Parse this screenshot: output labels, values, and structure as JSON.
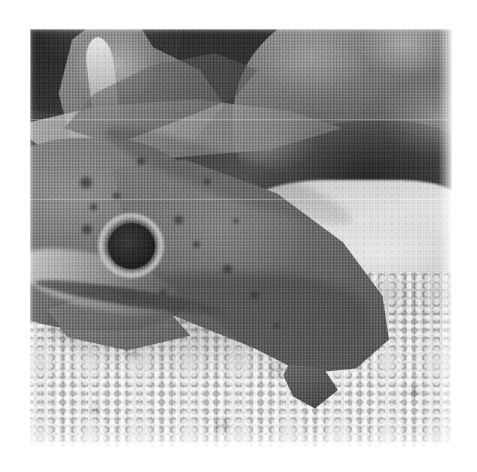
{
  "page": {
    "background_color": "#ffffff",
    "width": 477,
    "height": 472,
    "content_type": "scanned-halftone-photograph",
    "color_mode": "grayscale"
  },
  "figure": {
    "name": "underwater-photograph",
    "caption": "",
    "alt_text": "Black and white halftone photograph of a spotted catshark resting on a gravel seabed in front of rocks",
    "frame": {
      "left": 30,
      "top": 29,
      "width": 422,
      "height": 419
    },
    "tone": {
      "darkest": "#1a1a1a",
      "shadow": "#3a3a3a",
      "midtone": "#7b7b7b",
      "highlight": "#d8d8d8",
      "lightest": "#ececec"
    }
  },
  "scene": {
    "subject": "catshark",
    "habitat": "aquarium gravel bed with rocks",
    "regions": [
      {
        "id": "rock-top-left",
        "label": "dark rock, upper left corner"
      },
      {
        "id": "pale-rock-slab",
        "label": "pale angular rock slab, upper left"
      },
      {
        "id": "coral-prong",
        "label": "bright vertical prong, top left"
      },
      {
        "id": "boulder-upper-right",
        "label": "rough textured boulder, upper right"
      },
      {
        "id": "gravel-band",
        "label": "bright gravel band, mid right"
      },
      {
        "id": "gravel-bed",
        "label": "foreground gravel and sand bed"
      }
    ]
  },
  "fish": {
    "label": "catshark",
    "parts": [
      {
        "id": "head",
        "label": "head and snout"
      },
      {
        "id": "eye",
        "label": "eye"
      },
      {
        "id": "trunk",
        "label": "body flank"
      },
      {
        "id": "pectoral-fin",
        "label": "pectoral fin"
      },
      {
        "id": "vent-fin",
        "label": "pelvic fin"
      },
      {
        "id": "tail-fin",
        "label": "tail, upper left"
      },
      {
        "id": "mouth",
        "label": "jaw line"
      }
    ],
    "eye": {
      "pupil_center_pct": [
        24.0,
        51.7
      ],
      "pupil_diameter_pct": 11.2,
      "ring_diameter_pct": 15.6,
      "pupil_color": "#1e1e1e",
      "ring_color": "#c6c6c6"
    },
    "spots": [
      {
        "x_pct": 11.5,
        "y_pct": 35.0,
        "size_pct": 3.4
      },
      {
        "x_pct": 14.0,
        "y_pct": 41.5,
        "size_pct": 2.2
      },
      {
        "x_pct": 19.5,
        "y_pct": 39.0,
        "size_pct": 2.0
      },
      {
        "x_pct": 12.0,
        "y_pct": 46.5,
        "size_pct": 3.0
      },
      {
        "x_pct": 34.0,
        "y_pct": 44.5,
        "size_pct": 2.6
      },
      {
        "x_pct": 38.5,
        "y_pct": 50.5,
        "size_pct": 2.0
      },
      {
        "x_pct": 45.5,
        "y_pct": 56.0,
        "size_pct": 2.6
      },
      {
        "x_pct": 52.0,
        "y_pct": 62.5,
        "size_pct": 2.2
      },
      {
        "x_pct": 30.5,
        "y_pct": 62.0,
        "size_pct": 2.0
      },
      {
        "x_pct": 25.0,
        "y_pct": 30.5,
        "size_pct": 2.4
      },
      {
        "x_pct": 41.0,
        "y_pct": 35.5,
        "size_pct": 2.0
      },
      {
        "x_pct": 57.5,
        "y_pct": 70.0,
        "size_pct": 1.8
      },
      {
        "x_pct": 20.0,
        "y_pct": 55.0,
        "size_pct": 1.8
      },
      {
        "x_pct": 48.0,
        "y_pct": 45.0,
        "size_pct": 1.6
      }
    ]
  },
  "print": {
    "halftone_visible": true,
    "scan_seam_rows_pct": [
      21.5,
      40.5
    ]
  }
}
